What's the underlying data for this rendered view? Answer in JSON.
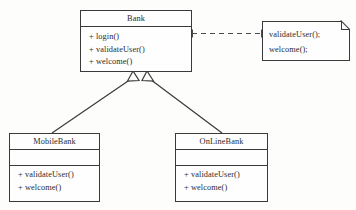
{
  "diagram": {
    "type": "uml-class-diagram",
    "background_color": "#fdfdfb",
    "stroke_color": "#3a3a3a",
    "fill_color": "#fefefe"
  },
  "classes": [
    {
      "id": "bank",
      "name": "Bank",
      "attributes": [],
      "operations": [
        "+ login()",
        "+ validateUser()",
        "+ welcome()"
      ]
    },
    {
      "id": "mobilebank",
      "name": "MobileBank",
      "attributes": [],
      "operations": [
        "+ validateUser()",
        "+ welcome()"
      ]
    },
    {
      "id": "onlinebank",
      "name": "OnLineBank",
      "attributes": [],
      "operations": [
        "+ validateUser()",
        "+ welcome()"
      ]
    }
  ],
  "note": {
    "id": "bank-note",
    "lines": [
      "validateUser();",
      "welcome();"
    ]
  },
  "relationships": [
    {
      "id": "generalization-mobilebank-bank",
      "kind": "generalization",
      "from": "MobileBank",
      "to": "Bank",
      "line_style": "solid",
      "arrowhead": "hollow-triangle"
    },
    {
      "id": "generalization-onlinebank-bank",
      "kind": "generalization",
      "from": "OnLineBank",
      "to": "Bank",
      "line_style": "solid",
      "arrowhead": "hollow-triangle"
    },
    {
      "id": "note-anchor-bank",
      "kind": "note-anchor",
      "from": "Bank",
      "to": "bank-note",
      "line_style": "dashed",
      "arrowhead": "none"
    }
  ]
}
